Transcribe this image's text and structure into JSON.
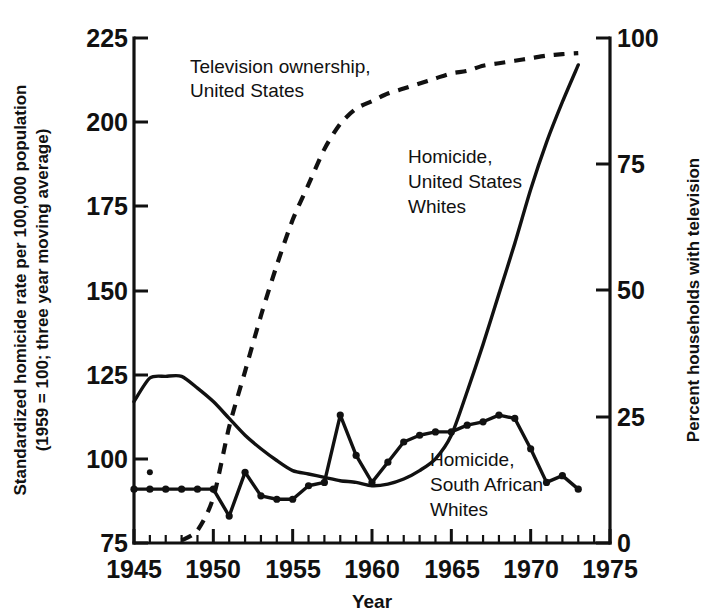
{
  "chart_data": {
    "type": "line",
    "title": "",
    "xlabel": "Year",
    "ylabel": "Standardized homicide rate per 100,000 population (1959 = 100; three year moving average)",
    "ylabel_line1": "Standardized homicide rate per 100,000 population",
    "ylabel_line2": "(1959 = 100; three year moving average)",
    "y2label": "Percent households with television",
    "xlim": [
      1945,
      1975
    ],
    "ylim": [
      75,
      225
    ],
    "y2lim": [
      0,
      100
    ],
    "grid": false,
    "legend_position": "inline-annotations",
    "xticks": [
      1945,
      1950,
      1955,
      1960,
      1965,
      1970,
      1975
    ],
    "xtick_labels": [
      "1945",
      "1950",
      "1955",
      "1960",
      "1965",
      "1970",
      "1975"
    ],
    "xminor_tick_interval": 1,
    "yticks": [
      75,
      100,
      125,
      150,
      175,
      200,
      225
    ],
    "ytick_labels": [
      "75",
      "100",
      "125",
      "150",
      "175",
      "200",
      "225"
    ],
    "y2ticks": [
      0,
      25,
      50,
      75,
      100
    ],
    "y2tick_labels": [
      "0",
      "25",
      "50",
      "75",
      "100"
    ],
    "series": [
      {
        "name": "Homicide, United States Whites",
        "axis": "left",
        "style": "solid",
        "markers": false,
        "annotation": "Homicide,\nUnited States\nWhites",
        "annotation_lines": [
          "Homicide,",
          "United States",
          "Whites"
        ],
        "x": [
          1945,
          1946,
          1947,
          1948,
          1949,
          1950,
          1951,
          1952,
          1953,
          1954,
          1955,
          1956,
          1957,
          1958,
          1959,
          1960,
          1961,
          1962,
          1963,
          1964,
          1965,
          1966,
          1967,
          1968,
          1969,
          1970,
          1971,
          1972,
          1973
        ],
        "values": [
          117,
          124,
          124.5,
          124.5,
          121,
          117,
          112,
          107,
          103,
          99.5,
          96.5,
          95.5,
          94.5,
          93.5,
          93,
          92,
          92.5,
          94,
          96.5,
          100,
          107,
          120,
          134,
          149,
          164,
          180,
          194,
          206,
          217
        ]
      },
      {
        "name": "Homicide, South African Whites",
        "axis": "left",
        "style": "solid",
        "markers": true,
        "annotation": "Homicide,\nSouth African\nWhites",
        "annotation_lines": [
          "Homicide,",
          "South African",
          "Whites"
        ],
        "x": [
          1945,
          1946,
          1947,
          1948,
          1949,
          1950,
          1951,
          1952,
          1953,
          1954,
          1955,
          1956,
          1957,
          1958,
          1959,
          1960,
          1961,
          1962,
          1963,
          1964,
          1965,
          1966,
          1967,
          1968,
          1969,
          1970,
          1971,
          1972,
          1973
        ],
        "values": [
          91,
          91,
          91,
          91,
          91,
          91,
          83,
          96,
          89,
          88,
          88,
          92,
          93,
          113,
          101,
          93,
          99,
          105,
          107,
          108,
          108,
          110,
          111,
          113,
          112,
          103,
          93,
          95,
          91
        ]
      },
      {
        "name": "Television ownership, United States",
        "axis": "right",
        "style": "dashed",
        "markers": false,
        "annotation": "Television ownership,\nUnited States",
        "annotation_lines": [
          "Television ownership,",
          "United States"
        ],
        "x": [
          1948,
          1949,
          1950,
          1951,
          1952,
          1953,
          1954,
          1955,
          1956,
          1957,
          1958,
          1959,
          1960,
          1961,
          1962,
          1963,
          1964,
          1965,
          1966,
          1967,
          1968,
          1969,
          1970,
          1971,
          1972,
          1973
        ],
        "values": [
          0.5,
          2.5,
          9,
          23,
          34,
          45,
          55,
          64,
          71,
          78,
          83,
          86,
          87.5,
          89,
          90,
          91,
          92,
          93,
          93.5,
          94.5,
          95,
          95.5,
          96,
          96.5,
          96.8,
          97
        ]
      }
    ]
  },
  "annotations": [
    {
      "id": "tv-annotation",
      "lines": [
        "Television ownership,",
        "United States"
      ]
    },
    {
      "id": "us-homicide-annotation",
      "lines": [
        "Homicide,",
        "United States",
        "Whites"
      ]
    },
    {
      "id": "sa-homicide-annotation",
      "lines": [
        "Homicide,",
        "South African",
        "Whites"
      ]
    }
  ]
}
